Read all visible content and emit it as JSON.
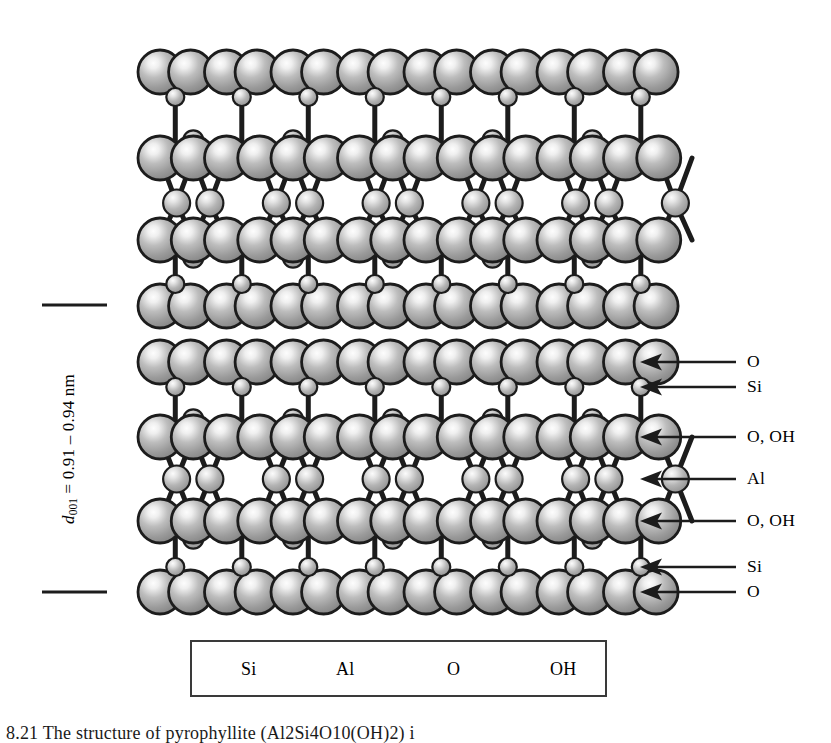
{
  "figure": {
    "caption_fragment": "8.21   The structure of pyrophyllite (Al2Si4O10(OH)2) i",
    "caption_visible": "partially clipped at bottom edge"
  },
  "dspacing": {
    "symbol": "d",
    "subscript": "001",
    "equals": "=",
    "value": "0.91 – 0.94",
    "unit": "nm",
    "full_text": "d001 = 0.91 – 0.94 nm",
    "tick_top_y": 305,
    "tick_bottom_y": 592
  },
  "arrow_labels": [
    {
      "label": "O",
      "y": 362
    },
    {
      "label": "Si",
      "y": 387
    },
    {
      "label": "O, OH",
      "y": 437
    },
    {
      "label": "Al",
      "y": 479
    },
    {
      "label": "O, OH",
      "y": 521
    },
    {
      "label": "Si",
      "y": 567
    },
    {
      "label": "O",
      "y": 592
    }
  ],
  "legend": {
    "items": [
      {
        "name": "Si",
        "kind": "si",
        "r": 9,
        "cx": 213,
        "label_x": 241
      },
      {
        "name": "Al",
        "kind": "al",
        "r": 14.5,
        "cx": 302,
        "label_x": 336
      },
      {
        "name": "O",
        "kind": "o",
        "r": 22,
        "cx": 407,
        "label_x": 447
      },
      {
        "name": "OH",
        "kind": "oh",
        "r": 22,
        "cx": 510,
        "label_x": 550
      }
    ],
    "center_y": 669
  },
  "colors": {
    "outline": "#1c1c1c",
    "sphere_mid": "#9e9e9e",
    "sphere_highlight": "#f2f2f2",
    "sphere_edge": "#6e6e6e",
    "bond": "#1c1c1c",
    "background": "#ffffff",
    "legend_border": "#3a3a3a",
    "text": "#000000"
  },
  "geometry": {
    "radii": {
      "o": 22,
      "si": 9,
      "al": 13.5
    },
    "x_left": 160,
    "x_step": 66.5,
    "n_cols": 8
  },
  "structure": {
    "description": "Two 2:1 TOT layers separated by an interlayer gap",
    "layers": [
      {
        "id": "upper-tot",
        "rows": [
          {
            "id": "u-o-apical-top",
            "species": "O",
            "kind": "o",
            "y": 72,
            "pattern": "top-o"
          },
          {
            "id": "u-si-top",
            "species": "Si",
            "kind": "si",
            "y": 97,
            "pattern": "si"
          },
          {
            "id": "u-ooh-upper",
            "species": "O, OH",
            "kind": "ooh",
            "y": 158,
            "pattern": "ooh"
          },
          {
            "id": "u-al",
            "species": "Al",
            "kind": "al",
            "y": 203,
            "pattern": "al"
          },
          {
            "id": "u-ooh-lower",
            "species": "O, OH",
            "kind": "ooh",
            "y": 240,
            "pattern": "ooh-down"
          },
          {
            "id": "u-si-bot",
            "species": "Si",
            "kind": "si",
            "y": 284,
            "pattern": "si"
          },
          {
            "id": "u-o-basal-bot",
            "species": "O",
            "kind": "o",
            "y": 306,
            "pattern": "bottom-o"
          }
        ]
      },
      {
        "id": "lower-tot",
        "rows": [
          {
            "id": "l-o-apical-top",
            "species": "O",
            "kind": "o",
            "y": 362,
            "pattern": "top-o"
          },
          {
            "id": "l-si-top",
            "species": "Si",
            "kind": "si",
            "y": 387,
            "pattern": "si"
          },
          {
            "id": "l-ooh-upper",
            "species": "O, OH",
            "kind": "ooh",
            "y": 437,
            "pattern": "ooh"
          },
          {
            "id": "l-al",
            "species": "Al",
            "kind": "al",
            "y": 479,
            "pattern": "al"
          },
          {
            "id": "l-ooh-lower",
            "species": "O, OH",
            "kind": "ooh",
            "y": 521,
            "pattern": "ooh-down"
          },
          {
            "id": "l-si-bot",
            "species": "Si",
            "kind": "si",
            "y": 567,
            "pattern": "si"
          },
          {
            "id": "l-o-basal-bot",
            "species": "O",
            "kind": "o",
            "y": 592,
            "pattern": "bottom-o"
          }
        ]
      }
    ]
  }
}
